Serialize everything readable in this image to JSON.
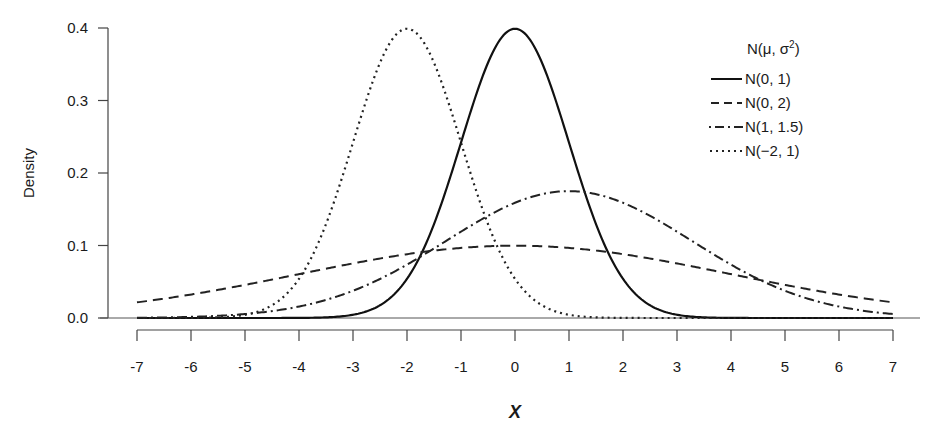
{
  "chart_data": {
    "type": "line",
    "title": "",
    "xlabel": "X",
    "ylabel": "Density",
    "xlim": [
      -7,
      7
    ],
    "ylim": [
      0,
      0.4
    ],
    "x_ticks": [
      "-7",
      "-6",
      "-5",
      "-4",
      "-3",
      "-2",
      "-1",
      "0",
      "1",
      "2",
      "3",
      "4",
      "5",
      "6",
      "7"
    ],
    "y_ticks": [
      "0.0",
      "0.1",
      "0.2",
      "0.3",
      "0.4"
    ],
    "grid": false,
    "legend_position": "top-right",
    "legend_title": "N(μ, σ²)",
    "series": [
      {
        "name": "N(0, 1)",
        "mu": 0,
        "variance": 1,
        "style": "solid",
        "peak": 0.399
      },
      {
        "name": "N(0, 2)",
        "mu": 0,
        "variance": 2,
        "style": "dashed",
        "peak": 0.282
      },
      {
        "name": "N(1, 1.5)",
        "mu": 1,
        "variance": 1.5,
        "style": "dashdot",
        "peak": 0.326
      },
      {
        "name": "N(−2, 1)",
        "mu": -2,
        "variance": 1,
        "style": "dotted",
        "peak": 0.399
      }
    ],
    "note": "Curves as drawn: N(0,1) peak ~0.40 at 0; N(0,2) peak ~0.10 (broad); N(1,1.5) peak ~0.175 at 1; N(-2,1) peak ~0.40 at -2"
  },
  "legend": {
    "title_main": "N(μ, σ",
    "title_sup": "2",
    "title_end": ")",
    "items": [
      {
        "label": "N(0, 1)"
      },
      {
        "label": "N(0, 2)"
      },
      {
        "label": "N(1, 1.5)"
      },
      {
        "label": "N(−2, 1)"
      }
    ]
  }
}
